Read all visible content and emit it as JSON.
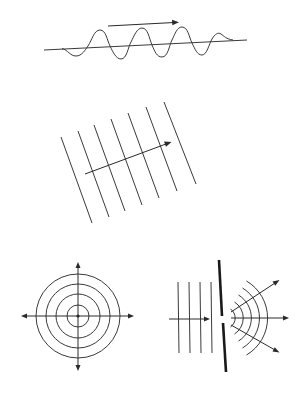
{
  "figure": {
    "panels": [
      {
        "id": "transverse-wave",
        "description": "Sinusoidal wave travelling along an axis with direction arrow"
      },
      {
        "id": "plane-wavefronts",
        "description": "Parallel plane wavefronts with propagation arrow"
      },
      {
        "id": "spherical-wavefronts",
        "description": "Concentric circular wavefronts radiating from a point source"
      },
      {
        "id": "single-slit-diffraction",
        "description": "Plane waves passing through a slit, producing circular wavefronts"
      }
    ],
    "colors": {
      "line": "#3a3a3a",
      "barrier": "#1a1a1a",
      "background": "#ffffff"
    },
    "plane_wavefront_count": 7,
    "concentric_circle_count": 4,
    "incident_wavefront_count": 4,
    "diffracted_arc_count": 5
  }
}
